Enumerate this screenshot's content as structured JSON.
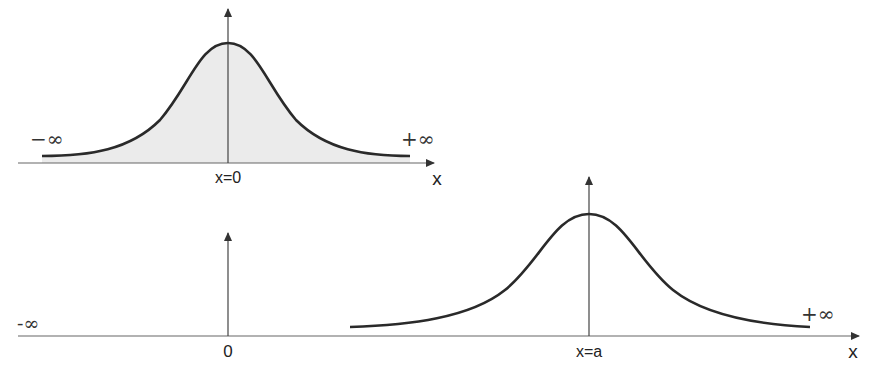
{
  "diagram": {
    "title": "",
    "colors": {
      "line": "#2a2a2a",
      "axis": "#555555",
      "fill": "#e6e6e6"
    },
    "panels": [
      {
        "id": "top",
        "description": "Bell-shaped curve centered at x=0, area under curve shaded",
        "center_label": "x=0",
        "axis_label": "x",
        "left_label": "−∞",
        "right_label": "+∞",
        "shaded": true
      },
      {
        "id": "bottom",
        "description": "Same bell-shaped curve shifted to be centered at x=a; origin marked 0",
        "origin_label": "0",
        "center_label": "x=a",
        "axis_label": "x",
        "left_label": "-∞",
        "right_label": "+∞",
        "shaded": false
      }
    ]
  }
}
